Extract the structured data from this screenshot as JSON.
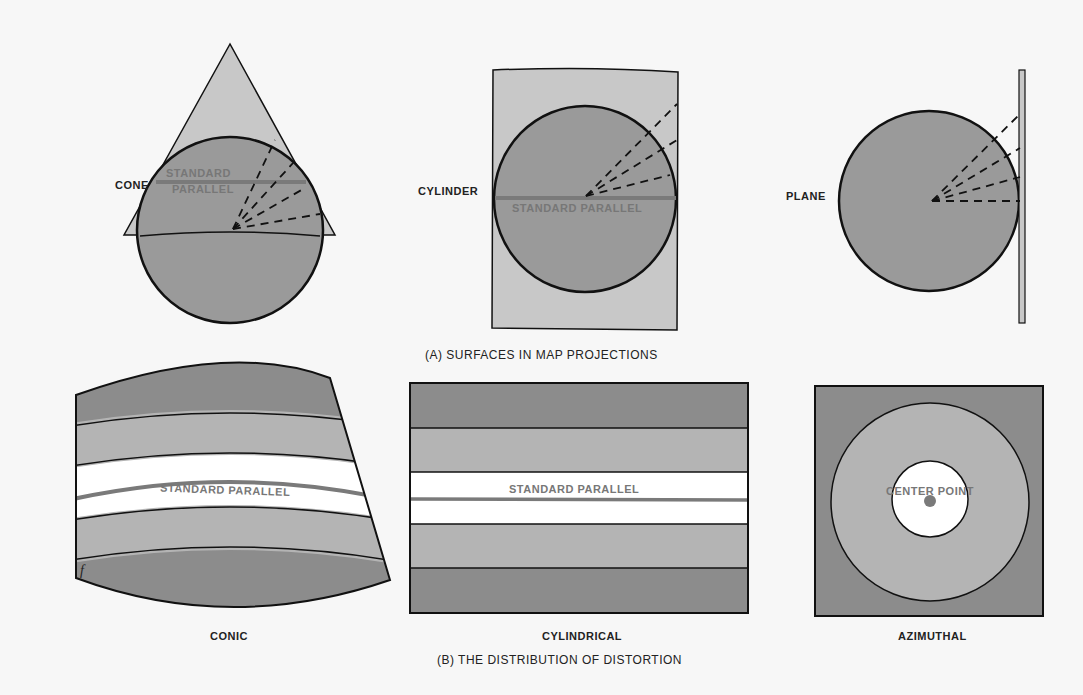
{
  "colors": {
    "background": "#f7f7f7",
    "dark_gray": "#8c8c8c",
    "mid_gray": "#b4b4b4",
    "light_gray": "#c8c8c8",
    "white_band": "#ffffff",
    "parallel_line": "#7a7a7a",
    "outline": "#111111"
  },
  "panel_a": {
    "caption": "(A) SURFACES IN MAP PROJECTIONS",
    "cone": {
      "label": "CONE",
      "parallel_line1": "STANDARD",
      "parallel_line2": "PARALLEL"
    },
    "cylinder": {
      "label": "CYLINDER",
      "parallel": "STANDARD PARALLEL"
    },
    "plane": {
      "label": "PLANE"
    }
  },
  "panel_b": {
    "caption": "(B) THE DISTRIBUTION OF DISTORTION",
    "conic": {
      "label": "CONIC",
      "parallel": "STANDARD PARALLEL",
      "corner_mark": "f"
    },
    "cylindrical": {
      "label": "CYLINDRICAL",
      "parallel": "STANDARD PARALLEL"
    },
    "azimuthal": {
      "label": "AZIMUTHAL",
      "center": "CENTER POINT"
    }
  }
}
